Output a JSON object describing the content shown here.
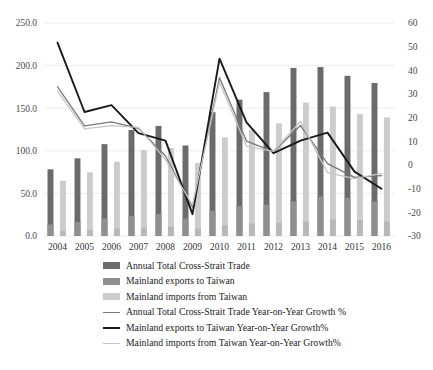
{
  "chart_data": {
    "type": "bar",
    "title": "",
    "subtitle": "",
    "xlabel": "",
    "ylabel": "",
    "categories": [
      "2004",
      "2005",
      "2006",
      "2007",
      "2008",
      "2009",
      "2010",
      "2011",
      "2012",
      "2013",
      "2014",
      "2015",
      "2016"
    ],
    "axes": {
      "left": {
        "label": "",
        "min": 0.0,
        "max": 250.0,
        "step": 50.0,
        "ticks": [
          "0.0",
          "50.0",
          "100.0",
          "150.0",
          "200.0",
          "250.0"
        ],
        "tick_values": [
          0.0,
          50.0,
          100.0,
          150.0,
          200.0,
          250.0
        ]
      },
      "right": {
        "label": "",
        "min": -30,
        "max": 60,
        "step": 10,
        "ticks": [
          "-30",
          "-20",
          "-10",
          "0",
          "10",
          "20",
          "30",
          "40",
          "50",
          "60"
        ],
        "tick_values": [
          -30,
          -20,
          -10,
          0,
          10,
          20,
          30,
          40,
          50,
          60
        ]
      }
    },
    "grid": true,
    "legend_position": "bottom",
    "series": [
      {
        "name": "Annual Total Cross-Strait Trade",
        "type": "bar",
        "axis": "left",
        "color": "#6b6b6b",
        "values": [
          78.3,
          91.2,
          107.8,
          124.5,
          129.2,
          106.2,
          145.4,
          160.0,
          168.9,
          197.3,
          198.3,
          188.0,
          179.6
        ]
      },
      {
        "name": "Mainland exports to Taiwan",
        "type": "bar",
        "axis": "left",
        "color": "#8f8f8f",
        "values": [
          13.5,
          16.6,
          20.7,
          23.5,
          25.9,
          20.5,
          29.7,
          35.1,
          36.8,
          40.6,
          46.2,
          44.9,
          40.4
        ]
      },
      {
        "name": "Mainland imports from Taiwan",
        "type": "bar",
        "axis": "left",
        "color": "#cccccc",
        "values": [
          64.8,
          74.7,
          87.1,
          101.0,
          103.3,
          85.7,
          115.7,
          124.9,
          132.2,
          156.6,
          152.0,
          143.1,
          139.2
        ]
      },
      {
        "name": "Annual Total Cross-Strait Trade Year-on-Year Growth %",
        "type": "line",
        "axis": "right",
        "color": "#777777",
        "values": [
          33.0,
          16.5,
          18.2,
          15.5,
          3.8,
          -17.8,
          36.9,
          10.1,
          5.6,
          16.7,
          0.6,
          -5.2,
          -4.5
        ]
      },
      {
        "name": "Mainland exports to Taiwan Year-on-Year Growth%",
        "type": "line",
        "axis": "right",
        "color": "#1a1a1a",
        "values": [
          51.7,
          22.4,
          25.3,
          13.5,
          10.3,
          -20.8,
          44.9,
          18.0,
          5.0,
          10.3,
          13.7,
          -2.8,
          -10.0
        ]
      },
      {
        "name": "Mainland imports from Taiwan Year-on-Year Growth%",
        "type": "line",
        "axis": "right",
        "color": "#c6c6c6",
        "values": [
          31.2,
          15.3,
          16.6,
          15.9,
          2.3,
          -17.0,
          35.0,
          8.0,
          5.8,
          18.4,
          -3.2,
          -5.8,
          -3.5
        ]
      }
    ]
  },
  "legend": {
    "items": [
      {
        "label": "Annual Total Cross-Strait Trade",
        "marker": "bar",
        "color": "#6b6b6b"
      },
      {
        "label": "Mainland exports to Taiwan",
        "marker": "bar",
        "color": "#8f8f8f"
      },
      {
        "label": "Mainland imports from Taiwan",
        "marker": "bar",
        "color": "#cccccc"
      },
      {
        "label": "Annual Total Cross-Strait Trade Year-on-Year Growth %",
        "marker": "line",
        "color": "#777777",
        "width": 1.4
      },
      {
        "label": "Mainland exports to Taiwan Year-on-Year Growth%",
        "marker": "line",
        "color": "#1a1a1a",
        "width": 2.0
      },
      {
        "label": "Mainland imports from Taiwan Year-on-Year Growth%",
        "marker": "line",
        "color": "#c6c6c6",
        "width": 1.4
      }
    ]
  }
}
